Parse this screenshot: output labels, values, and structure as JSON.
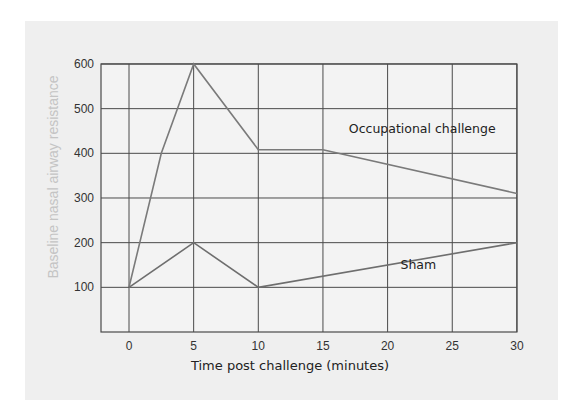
{
  "chart_data": {
    "type": "line",
    "title": "",
    "xlabel": "Time post challenge (minutes)",
    "ylabel": "Baseline nasal airway resistance",
    "x_ticks": [
      0,
      5,
      10,
      15,
      20,
      25,
      30
    ],
    "y_ticks": [
      100,
      200,
      300,
      400,
      500,
      600
    ],
    "xlim": [
      -2,
      30
    ],
    "ylim": [
      0,
      600
    ],
    "grid": true,
    "legend": "inline annotations",
    "series": [
      {
        "name": "Occupational challenge",
        "points": [
          [
            0,
            100
          ],
          [
            2.5,
            400
          ],
          [
            5,
            600
          ],
          [
            10,
            408
          ],
          [
            15,
            408
          ],
          [
            30,
            310
          ]
        ],
        "color": "#7a7a7a"
      },
      {
        "name": "Sham",
        "points": [
          [
            0,
            100
          ],
          [
            5,
            200
          ],
          [
            10,
            100
          ],
          [
            30,
            200
          ]
        ],
        "color": "#6e6e6e"
      }
    ],
    "annotations": [
      {
        "text": "Occupational challenge",
        "x": 17,
        "y": 445
      },
      {
        "text": "Sham",
        "x": 21,
        "y": 140
      }
    ]
  },
  "colors": {
    "panel_bg": "#efefef",
    "grid": "#4a4a4a",
    "ylabel": "#c4c4c4"
  }
}
